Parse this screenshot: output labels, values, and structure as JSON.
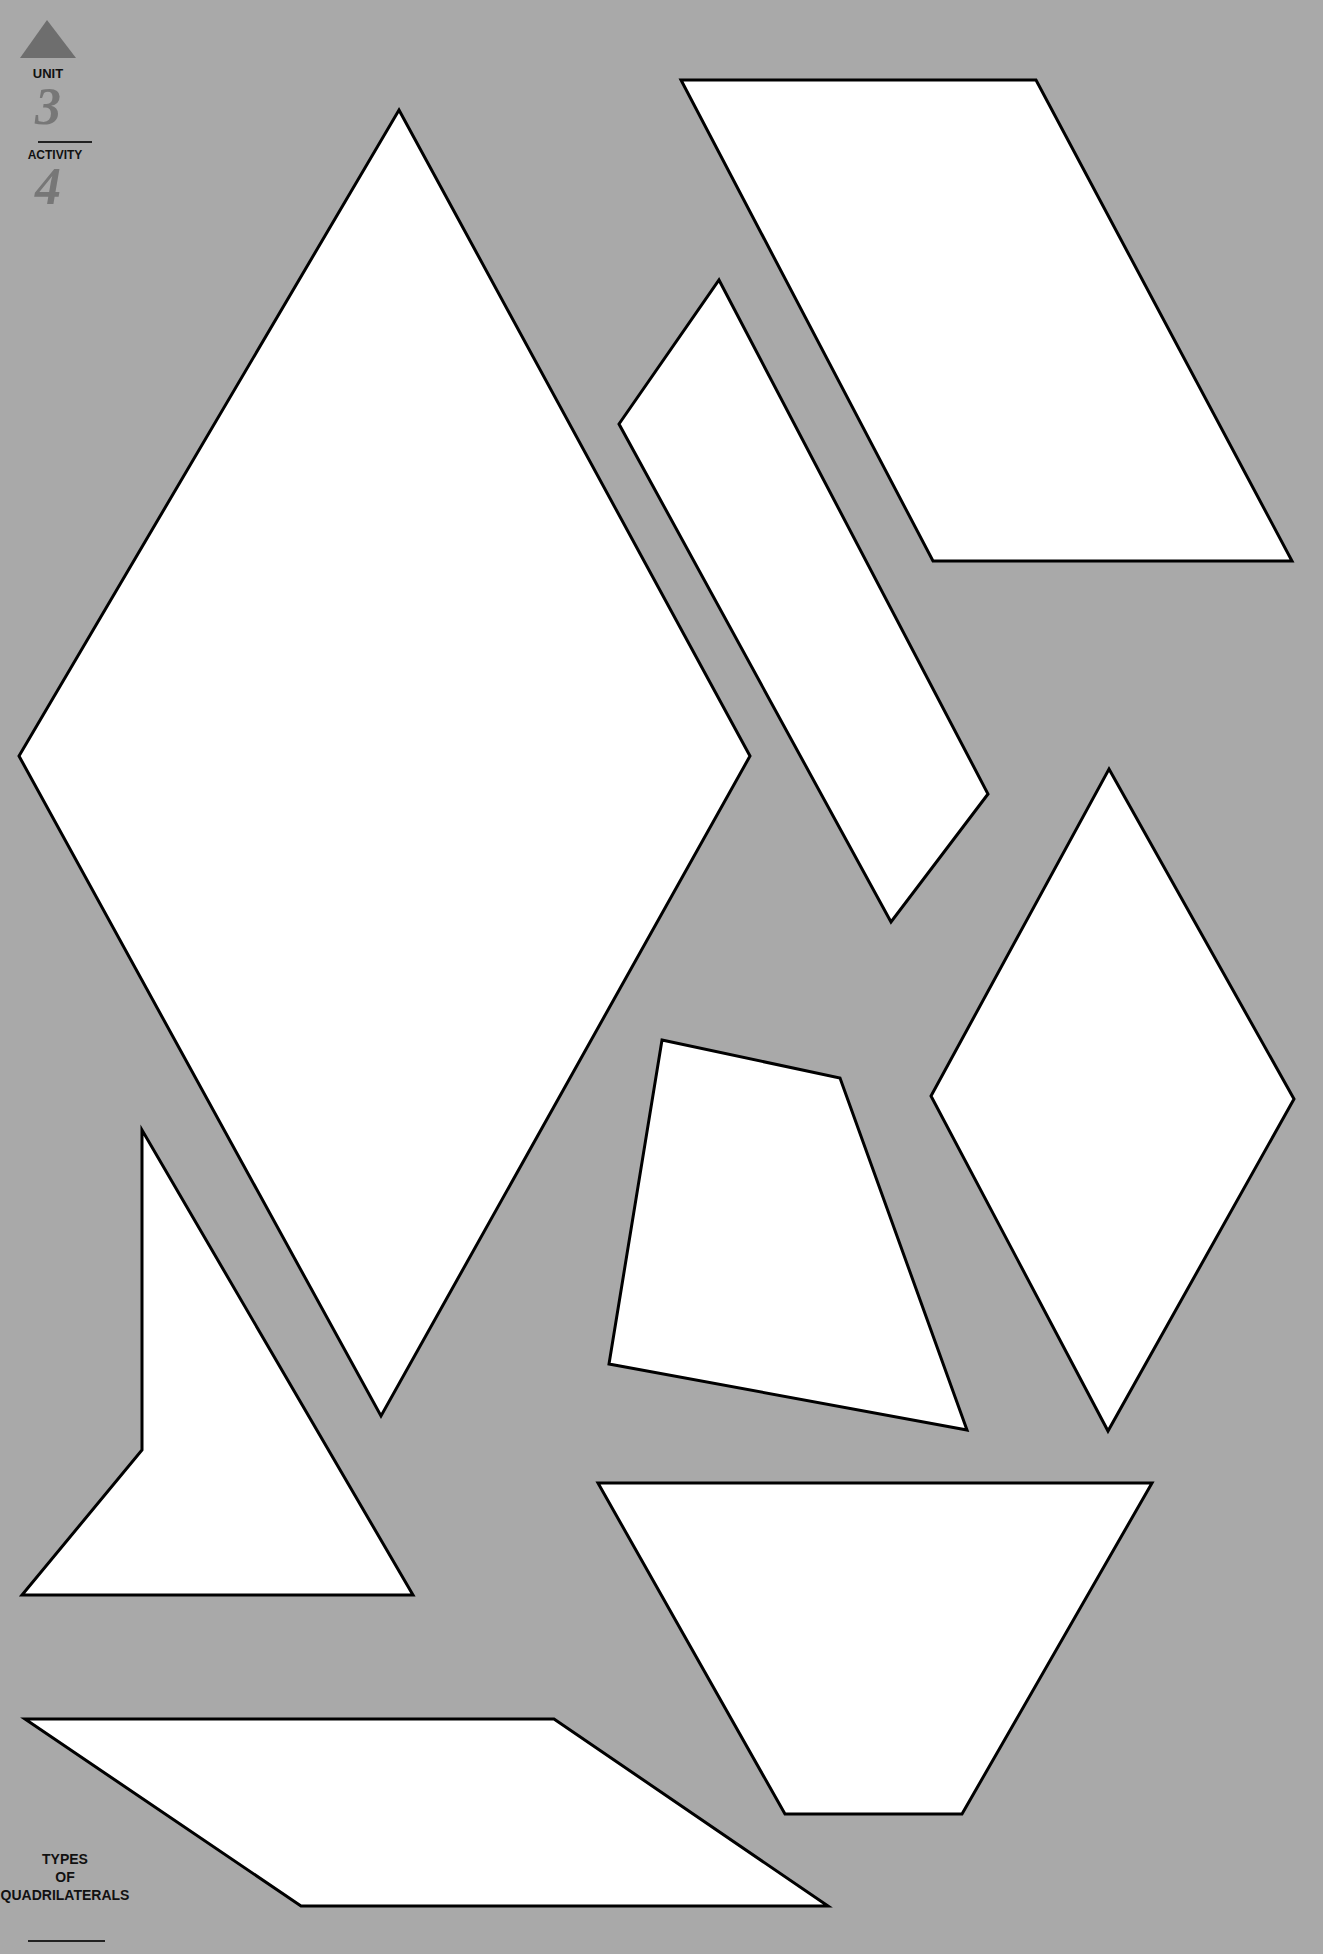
{
  "header": {
    "unit_label": "UNIT",
    "unit_number": "3",
    "activity_label": "ACTIVITY",
    "activity_number": "4",
    "arrow_icon": "up-triangle"
  },
  "footer": {
    "title_line1": "TYPES",
    "title_line2": "OF",
    "title_line3": "QUADRILATERALS"
  },
  "colors": {
    "background": "#a9a9a9",
    "shape_fill": "#ffffff",
    "outline": "#000000",
    "arrow": "#6e6e6e"
  }
}
